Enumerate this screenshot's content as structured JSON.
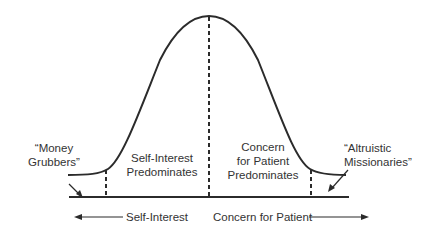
{
  "diagram": {
    "type": "bell-curve",
    "region_labels": {
      "left_tail": [
        "“Money",
        "Grubbers”"
      ],
      "left_center": [
        "Self-Interest",
        "Predominates"
      ],
      "right_center": [
        "Concern",
        "for Patient",
        "Predominates"
      ],
      "right_tail": [
        "“Altruistic",
        "Missionaries”"
      ]
    },
    "axis": {
      "left_label": "Self-Interest",
      "right_label": "Concern for Patient"
    },
    "colors": {
      "line": "#2b2b2b",
      "text": "#333333",
      "background": "#ffffff"
    }
  }
}
